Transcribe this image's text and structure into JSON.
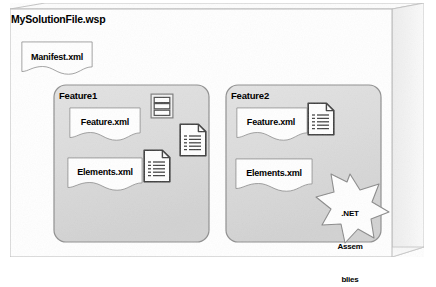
{
  "diagram": {
    "type": "3d-package-container-diagram",
    "solution": {
      "title": "MySolutionFile.wsp",
      "manifest": {
        "label": "Manifest.xml",
        "shape": "document"
      }
    },
    "features": [
      {
        "title": "Feature1",
        "documents": [
          {
            "label": "Feature.xml",
            "shape": "document"
          },
          {
            "label": "Elements.xml",
            "shape": "document"
          }
        ],
        "icons": [
          {
            "name": "stack-icon"
          },
          {
            "name": "file-list-icon"
          },
          {
            "name": "file-list-icon"
          }
        ]
      },
      {
        "title": "Feature2",
        "documents": [
          {
            "label": "Feature.xml",
            "shape": "document"
          },
          {
            "label": "Elements.xml",
            "shape": "document"
          }
        ],
        "icons": [
          {
            "name": "file-list-icon"
          }
        ],
        "burst": {
          "lines": [
            ".NET",
            "Assem",
            "blies"
          ],
          "shape": "7-point-star"
        }
      }
    ],
    "colors": {
      "page_background": "#ffffff",
      "box_front_face": "#ffffff",
      "box_side_face": "#f2f2f2",
      "box_bottom_face": "#f4f4f4",
      "feature_fill": "#dedede",
      "feature_stroke": "#8c8c8c",
      "document_fill": "#ffffff",
      "document_stroke": "#808080",
      "outline": "#b4b4b4",
      "icon_stroke": "#3c3c3c",
      "text": "#000000"
    }
  }
}
